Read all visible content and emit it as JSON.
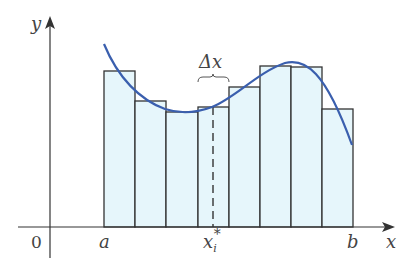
{
  "diagram": {
    "axes": {
      "x_label": "x",
      "y_label": "y",
      "origin_label": "0"
    },
    "interval": {
      "left_label": "a",
      "right_label": "b"
    },
    "delta_label": "Δx",
    "sample_point_label": "x",
    "sample_point_sub": "i",
    "sample_point_sup": "*",
    "colors": {
      "curve": "#3a5fae",
      "rect_fill": "#e6f6fb",
      "rect_stroke": "#333333",
      "axis": "#333333",
      "text": "#444444"
    },
    "rectangle_count": 8,
    "rectangles": [
      {
        "x0": 104,
        "x1": 135,
        "top": 71
      },
      {
        "x0": 135,
        "x1": 166,
        "top": 101
      },
      {
        "x0": 166,
        "x1": 198,
        "top": 112
      },
      {
        "x0": 198,
        "x1": 229,
        "top": 107
      },
      {
        "x0": 229,
        "x1": 260,
        "top": 87
      },
      {
        "x0": 260,
        "x1": 291,
        "top": 66
      },
      {
        "x0": 291,
        "x1": 322,
        "top": 67
      },
      {
        "x0": 322,
        "x1": 353,
        "top": 109
      }
    ]
  }
}
